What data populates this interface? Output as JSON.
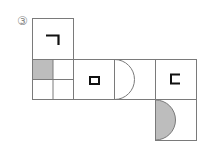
{
  "problem": {
    "number_label": "③"
  },
  "net": {
    "description": "Cube net with six faces",
    "colors": {
      "line": "#7a7a7a",
      "shade": "#bdbdbd",
      "symbol": "#111111"
    },
    "faces": [
      {
        "id": "top",
        "symbol": "ㄱ"
      },
      {
        "id": "left-grid",
        "symbol": "2x2 grid, top-left shaded"
      },
      {
        "id": "middle",
        "symbol": "ㅁ"
      },
      {
        "id": "semicircle",
        "symbol": "half circle outline"
      },
      {
        "id": "right",
        "symbol": "ㄷ"
      },
      {
        "id": "bottom",
        "symbol": "shaded half circle"
      }
    ]
  }
}
